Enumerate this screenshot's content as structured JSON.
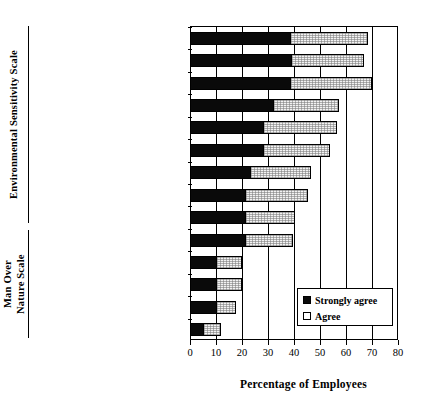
{
  "chart_data": {
    "type": "bar",
    "orientation": "horizontal",
    "stacked": true,
    "title": "",
    "xlabel": "Percentage of Employees",
    "ylabel": "",
    "xlim": [
      0,
      80
    ],
    "xticks": [
      0,
      10,
      20,
      30,
      40,
      50,
      60,
      70,
      80
    ],
    "grid": true,
    "legend_position": "bottom-right",
    "categories": [
      "Live in harmony with nature",
      "Mankind abusing environment",
      "Conserve now or lower quality",
      "Human interference yields disaster",
      "Earth is a spaceship limited",
      "Balance of nature is delicate",
      "Air cleaner if stop solo commute",
      "Limits to growth",
      "Approaching limit of people",
      "Develop steady state economy",
      "Mankind to rule over nature",
      "Right to modify environment",
      "Nature exists for humans",
      "Humans don't need to adapt"
    ],
    "series": [
      {
        "name": "Strongly agree",
        "color": "#0a0a0a",
        "values": [
          38.5,
          39,
          38.5,
          32,
          28,
          28,
          23,
          21,
          21,
          21,
          10,
          10,
          10,
          5
        ]
      },
      {
        "name": "Agree",
        "color": "#f2f2f2",
        "values": [
          30,
          28,
          31.5,
          25.5,
          28.5,
          26,
          23.5,
          24.5,
          19.5,
          18.5,
          10,
          10,
          7.5,
          7
        ]
      }
    ],
    "totals": [
      68.5,
      67,
      70,
      57.5,
      56.5,
      54,
      46.5,
      45.5,
      40.5,
      39.5,
      20,
      20,
      17.5,
      12
    ],
    "group_axis_labels": [
      {
        "label": "Environmental Sensitivity Scale",
        "categories_count": 10
      },
      {
        "label": "Man Over\nNature Scale",
        "categories_count": 4
      }
    ]
  },
  "groups": {
    "environmental": "Environmental Sensitivity Scale",
    "man_over_nature_line1": "Man Over",
    "man_over_nature_line2": "Nature Scale"
  },
  "legend": {
    "strongly_agree_label": "Strongly agree",
    "agree_label": "Agree"
  },
  "axis": {
    "x_title": "Percentage of Employees"
  }
}
